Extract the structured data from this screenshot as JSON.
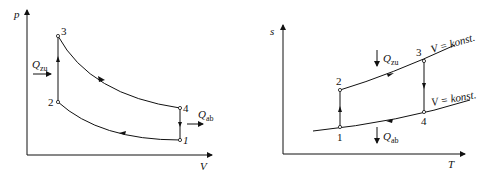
{
  "left_diagram": {
    "type": "p-V diagram",
    "y_axis_label": "p",
    "x_axis_label": "V",
    "points": [
      {
        "id": "1",
        "label": "1"
      },
      {
        "id": "2",
        "label": "2"
      },
      {
        "id": "3",
        "label": "3"
      },
      {
        "id": "4",
        "label": "4"
      }
    ],
    "heat_in": {
      "symbol": "Q",
      "subscript": "zu"
    },
    "heat_out": {
      "symbol": "Q",
      "subscript": "ab"
    }
  },
  "right_diagram": {
    "type": "s-T diagram",
    "y_axis_label": "s",
    "x_axis_label": "T",
    "points": [
      {
        "id": "1",
        "label": "1"
      },
      {
        "id": "2",
        "label": "2"
      },
      {
        "id": "3",
        "label": "3"
      },
      {
        "id": "4",
        "label": "4"
      }
    ],
    "heat_in": {
      "symbol": "Q",
      "subscript": "zu"
    },
    "heat_out": {
      "symbol": "Q",
      "subscript": "ab"
    },
    "isochore_upper": "V = konst.",
    "isochore_lower": "V = konst."
  }
}
